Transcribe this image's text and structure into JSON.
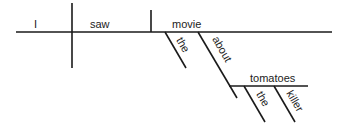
{
  "diagram": {
    "type": "sentence-diagram",
    "sentence": "I saw the movie about the killer tomatoes",
    "words": {
      "subject": "I",
      "verb": "saw",
      "object": "movie",
      "object_article": "the",
      "preposition": "about",
      "prep_object": "tomatoes",
      "prep_object_article": "the",
      "prep_object_modifier": "killer"
    },
    "line_color": "#1a1a1a"
  }
}
